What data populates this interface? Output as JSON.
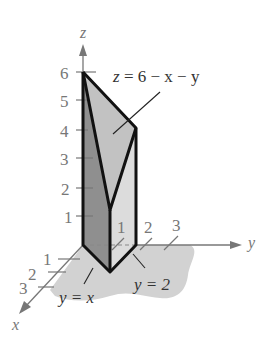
{
  "figure": {
    "type": "3d-solid-region",
    "axes": {
      "z": {
        "label": "z",
        "ticks": [
          "1",
          "2",
          "3",
          "4",
          "5",
          "6"
        ]
      },
      "y": {
        "label": "y",
        "ticks": [
          "1",
          "2",
          "3"
        ]
      },
      "x": {
        "label": "x",
        "ticks": [
          "1",
          "2",
          "3"
        ]
      }
    },
    "annotations": {
      "surface": {
        "lhs": "z",
        "rhs": "6 − x − y",
        "text": "z = 6 − x − y"
      },
      "plane_left": {
        "text": "y = x"
      },
      "plane_right": {
        "text": "y = 2"
      }
    },
    "colors": {
      "axis": "#777777",
      "edge": "#111111",
      "top_face": "#c4c4c4",
      "left_face": "#8e8e8e",
      "right_face": "#dadada",
      "ground": "#cfcfcf"
    }
  }
}
